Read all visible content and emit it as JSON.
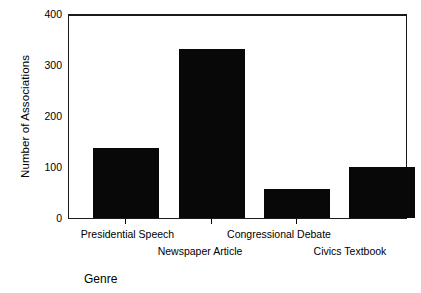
{
  "chart_data": {
    "type": "bar",
    "title": "",
    "xlabel": "Genre",
    "ylabel": "Number of Associations",
    "categories": [
      "Presidential Speech",
      "Newspaper Article",
      "Congressional Debate",
      "Civics Textbook"
    ],
    "values": [
      137,
      330,
      57,
      100
    ],
    "ylim": [
      0,
      400
    ],
    "yticks": [
      0,
      100,
      200,
      300,
      400
    ],
    "ytick_labels": [
      "0",
      "100",
      "200",
      "300",
      "400"
    ],
    "grid": false,
    "legend": null,
    "bar_color": "#080808",
    "axis_color": "#1a1a1a",
    "background": "#ffffff",
    "label_rows": [
      {
        "row": 0,
        "labels": [
          "Presidential Speech",
          "Congressional Debate"
        ]
      },
      {
        "row": 1,
        "labels": [
          "Newspaper Article",
          "Civics Textbook"
        ]
      }
    ]
  }
}
